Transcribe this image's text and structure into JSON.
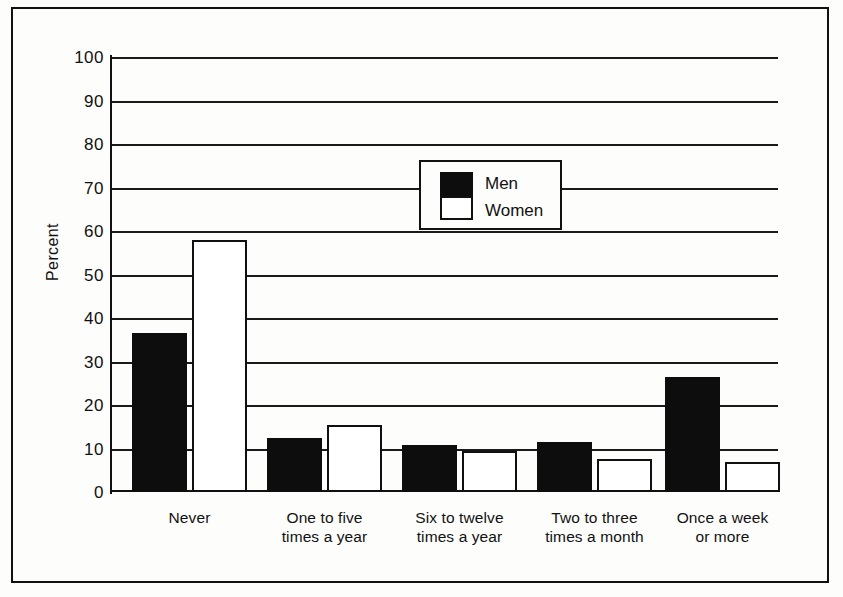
{
  "chart_data": {
    "type": "bar",
    "title": "",
    "subtitle": "",
    "xlabel": "",
    "ylabel": "Percent",
    "ylim": [
      0,
      100
    ],
    "yticks": [
      0,
      10,
      20,
      30,
      40,
      50,
      60,
      70,
      80,
      90,
      100
    ],
    "ytick_labels": [
      "0",
      "10",
      "20",
      "30",
      "40",
      "50",
      "60",
      "70",
      "80",
      "90",
      "100"
    ],
    "grid": true,
    "legend_position": "upper-center",
    "categories": [
      "Never",
      "One to five times a year",
      "Six to twelve times a year",
      "Two to three times a month",
      "Once a week or more"
    ],
    "category_lines": [
      [
        "Never"
      ],
      [
        "One to five",
        "times a year"
      ],
      [
        "Six to twelve",
        "times a year"
      ],
      [
        "Two to three",
        "times a month"
      ],
      [
        "Once a week",
        "or more"
      ]
    ],
    "series": [
      {
        "name": "Men",
        "color": "#0d0d0d",
        "fill": "solid-black",
        "values": [
          36.5,
          12.5,
          10.7,
          11.5,
          26.5
        ]
      },
      {
        "name": "Women",
        "color": "#ffffff",
        "fill": "white-outlined",
        "values": [
          58.0,
          15.5,
          9.5,
          7.7,
          7.0
        ]
      }
    ]
  },
  "legend": {
    "entries": [
      {
        "label": "Men",
        "swatch": "black-square"
      },
      {
        "label": "Women",
        "swatch": "white-square"
      }
    ]
  },
  "colors": {
    "ink": "#111111",
    "paper": "#fdfdfb",
    "men_fill": "#0d0d0d",
    "women_fill": "#ffffff"
  }
}
